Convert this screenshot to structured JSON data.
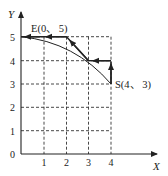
{
  "diagram": {
    "axes": {
      "x_label": "X",
      "y_label": "Y",
      "origin_label": "0",
      "x_ticks": [
        "1",
        "2",
        "3",
        "4"
      ],
      "y_ticks": [
        "1",
        "2",
        "3",
        "4",
        "5"
      ]
    },
    "points": {
      "start": {
        "label": "S(4、 3)",
        "x": 4,
        "y": 3
      },
      "end": {
        "label": "E(0、 5)",
        "x": 0,
        "y": 5
      }
    },
    "path": [
      {
        "from": [
          4,
          3
        ],
        "to": [
          4,
          4
        ]
      },
      {
        "from": [
          4,
          4
        ],
        "to": [
          3,
          4
        ]
      },
      {
        "from": [
          3,
          4
        ],
        "to": [
          2,
          5
        ]
      },
      {
        "from": [
          2,
          5
        ],
        "to": [
          0,
          5
        ]
      }
    ],
    "curve": {
      "from": [
        0,
        5
      ],
      "to": [
        4,
        3
      ],
      "description": "smooth arc from E to S"
    },
    "colors": {
      "line": "#222222",
      "grid": "#333333",
      "background": "#ffffff"
    }
  }
}
